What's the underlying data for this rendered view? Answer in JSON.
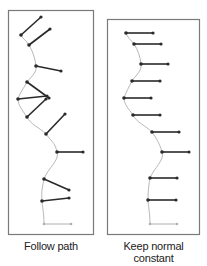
{
  "panels": [
    {
      "id": "follow-path",
      "caption": "Follow path",
      "box": {
        "x": 8,
        "y": 10,
        "w": 85,
        "h": 224
      },
      "path": "M44,224 C44,212 42,205 42,201 C41,190 43,185 44,179 C48,168 60,160 57,152 C55,142 50,140 46,134 C40,128 30,124 27,117 C22,110 18,105 18,99 C20,92 24,88 27,82 C32,76 37,72 36,66 C35,58 33,52 29,45 C26,40 22,38 21,35",
      "segments": [
        {
          "x1": 21,
          "y1": 35,
          "x2": 41,
          "y2": 17
        },
        {
          "x1": 29,
          "y1": 45,
          "x2": 50,
          "y2": 29
        },
        {
          "x1": 36,
          "y1": 66,
          "x2": 61,
          "y2": 71
        },
        {
          "x1": 27,
          "y1": 82,
          "x2": 49,
          "y2": 98
        },
        {
          "x1": 18,
          "y1": 99,
          "x2": 47,
          "y2": 96
        },
        {
          "x1": 27,
          "y1": 117,
          "x2": 46,
          "y2": 99
        },
        {
          "x1": 46,
          "y1": 134,
          "x2": 65,
          "y2": 114
        },
        {
          "x1": 57,
          "y1": 152,
          "x2": 83,
          "y2": 152
        },
        {
          "x1": 44,
          "y1": 179,
          "x2": 69,
          "y2": 190
        },
        {
          "x1": 42,
          "y1": 201,
          "x2": 69,
          "y2": 198
        }
      ],
      "start_segment": {
        "x1": 44,
        "y1": 224,
        "x2": 71,
        "y2": 224
      }
    },
    {
      "id": "keep-normal-constant",
      "caption": "Keep normal constant",
      "box": {
        "x": 107,
        "y": 19,
        "w": 92,
        "h": 215
      },
      "path": "M150,224 C150,212 148,205 148,200 C148,190 149,184 150,178 C154,168 165,160 162,152 C159,142 156,138 152,132 C146,126 136,122 133,115 C128,108 124,104 124,98 C126,92 129,87 132,81 C136,75 142,71 141,64 C140,56 138,50 134,44 C131,40 127,37 126,33",
      "segments": [
        {
          "x1": 126,
          "y1": 33,
          "x2": 153,
          "y2": 33
        },
        {
          "x1": 134,
          "y1": 44,
          "x2": 161,
          "y2": 44
        },
        {
          "x1": 141,
          "y1": 64,
          "x2": 168,
          "y2": 64
        },
        {
          "x1": 132,
          "y1": 81,
          "x2": 160,
          "y2": 81
        },
        {
          "x1": 124,
          "y1": 98,
          "x2": 151,
          "y2": 98
        },
        {
          "x1": 133,
          "y1": 115,
          "x2": 160,
          "y2": 115
        },
        {
          "x1": 152,
          "y1": 132,
          "x2": 179,
          "y2": 132
        },
        {
          "x1": 162,
          "y1": 152,
          "x2": 189,
          "y2": 152
        },
        {
          "x1": 150,
          "y1": 178,
          "x2": 177,
          "y2": 178
        },
        {
          "x1": 148,
          "y1": 200,
          "x2": 176,
          "y2": 200
        }
      ],
      "start_segment": {
        "x1": 150,
        "y1": 224,
        "x2": 177,
        "y2": 224
      }
    }
  ],
  "colors": {
    "box_stroke": "#7a7a7a",
    "path_stroke": "#b8b8b8",
    "segment_stroke": "#2a2a2a",
    "start_segment_stroke": "#b0b0b0",
    "caption": "#222222"
  }
}
